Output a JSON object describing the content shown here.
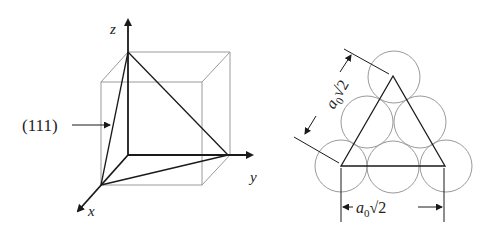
{
  "figure": {
    "left_panel": {
      "title": "Cubic unit cell with (111) plane",
      "axes": {
        "x_label": "x",
        "y_label": "y",
        "z_label": "z"
      },
      "plane_label": "(111)"
    },
    "right_panel": {
      "title": "Atom packing on (111) plane",
      "side_label_prefix": "a",
      "side_label_subscript": "0",
      "side_label_root": "√2",
      "bottom_label_prefix": "a",
      "bottom_label_subscript": "0",
      "bottom_label_root": "√2",
      "atom_count": 6
    },
    "colors": {
      "line": "#1a1a1a",
      "cube": "#9a9a9a",
      "atom": "#9a9a9a"
    }
  }
}
